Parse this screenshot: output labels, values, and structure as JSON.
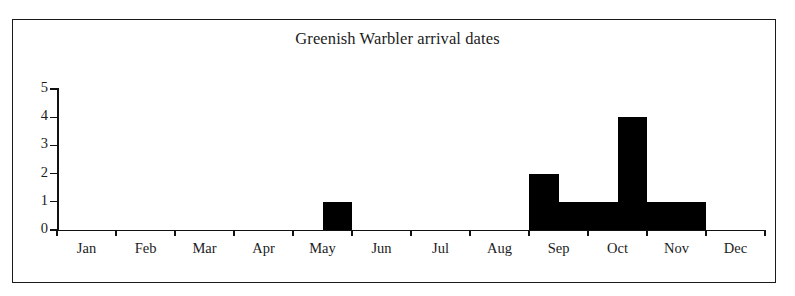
{
  "figure": {
    "title": "Greenish Warbler arrival dates",
    "background_color": "#ffffff",
    "frame_color": "#1a1a1a",
    "bar_color": "#000000",
    "axis_color": "#111111"
  },
  "chart_data": {
    "type": "bar",
    "title": "Greenish Warbler arrival dates",
    "xlabel": "",
    "ylabel": "",
    "ylim": [
      0,
      5
    ],
    "ytick_labels": [
      "0",
      "1",
      "2",
      "3",
      "4",
      "5"
    ],
    "ytick_values": [
      0,
      1,
      2,
      3,
      4,
      5
    ],
    "grid": false,
    "legend": "none",
    "categories": [
      "Jan",
      "Feb",
      "Mar",
      "Apr",
      "May",
      "Jun",
      "Jul",
      "Aug",
      "Sep",
      "Oct",
      "Nov",
      "Dec"
    ],
    "xtick_labels": [
      "Jan",
      "Feb",
      "Mar",
      "Apr",
      "May",
      "Jun",
      "Jul",
      "Aug",
      "Sep",
      "Oct",
      "Nov",
      "Dec"
    ],
    "bin_width_months": 0.5,
    "note": "Histogram of arrival dates binned by half-month; bars drawn as contiguous bins along a 12-month axis.",
    "bins": [
      {
        "label": "Jan 1-15",
        "month": "Jan",
        "half": 1,
        "start_month_index": 0.0,
        "value": 0
      },
      {
        "label": "Jan 16-31",
        "month": "Jan",
        "half": 2,
        "start_month_index": 0.5,
        "value": 0
      },
      {
        "label": "Feb 1-14",
        "month": "Feb",
        "half": 1,
        "start_month_index": 1.0,
        "value": 0
      },
      {
        "label": "Feb 15-28",
        "month": "Feb",
        "half": 2,
        "start_month_index": 1.5,
        "value": 0
      },
      {
        "label": "Mar 1-15",
        "month": "Mar",
        "half": 1,
        "start_month_index": 2.0,
        "value": 0
      },
      {
        "label": "Mar 16-31",
        "month": "Mar",
        "half": 2,
        "start_month_index": 2.5,
        "value": 0
      },
      {
        "label": "Apr 1-15",
        "month": "Apr",
        "half": 1,
        "start_month_index": 3.0,
        "value": 0
      },
      {
        "label": "Apr 16-30",
        "month": "Apr",
        "half": 2,
        "start_month_index": 3.5,
        "value": 0
      },
      {
        "label": "May 1-15",
        "month": "May",
        "half": 1,
        "start_month_index": 4.0,
        "value": 0
      },
      {
        "label": "May 16-31",
        "month": "May",
        "half": 2,
        "start_month_index": 4.5,
        "value": 1
      },
      {
        "label": "Jun 1-15",
        "month": "Jun",
        "half": 1,
        "start_month_index": 5.0,
        "value": 0
      },
      {
        "label": "Jun 16-30",
        "month": "Jun",
        "half": 2,
        "start_month_index": 5.5,
        "value": 0
      },
      {
        "label": "Jul 1-15",
        "month": "Jul",
        "half": 1,
        "start_month_index": 6.0,
        "value": 0
      },
      {
        "label": "Jul 16-31",
        "month": "Jul",
        "half": 2,
        "start_month_index": 6.5,
        "value": 0
      },
      {
        "label": "Aug 1-15",
        "month": "Aug",
        "half": 1,
        "start_month_index": 7.0,
        "value": 0
      },
      {
        "label": "Aug 16-31",
        "month": "Aug",
        "half": 2,
        "start_month_index": 7.5,
        "value": 0
      },
      {
        "label": "Sep 1-15",
        "month": "Sep",
        "half": 1,
        "start_month_index": 8.0,
        "value": 2
      },
      {
        "label": "Sep 16-30",
        "month": "Sep",
        "half": 2,
        "start_month_index": 8.5,
        "value": 1
      },
      {
        "label": "Oct 1-15",
        "month": "Oct",
        "half": 1,
        "start_month_index": 9.0,
        "value": 1
      },
      {
        "label": "Oct 16-31",
        "month": "Oct",
        "half": 2,
        "start_month_index": 9.5,
        "value": 4
      },
      {
        "label": "Nov 1-15",
        "month": "Nov",
        "half": 1,
        "start_month_index": 10.0,
        "value": 1
      },
      {
        "label": "Nov 16-30",
        "month": "Nov",
        "half": 2,
        "start_month_index": 10.5,
        "value": 1
      },
      {
        "label": "Dec 1-15",
        "month": "Dec",
        "half": 1,
        "start_month_index": 11.0,
        "value": 0
      },
      {
        "label": "Dec 16-31",
        "month": "Dec",
        "half": 2,
        "start_month_index": 11.5,
        "value": 0
      }
    ],
    "nonzero_bars": [
      {
        "label": "May 16-31",
        "value": 1
      },
      {
        "label": "Sep 1-15",
        "value": 2
      },
      {
        "label": "Sep 16-30",
        "value": 1
      },
      {
        "label": "Oct 1-15",
        "value": 1
      },
      {
        "label": "Oct 16-31",
        "value": 4
      },
      {
        "label": "Nov 1-15",
        "value": 1
      },
      {
        "label": "Nov 16-30",
        "value": 1
      }
    ],
    "total_count": 11
  }
}
